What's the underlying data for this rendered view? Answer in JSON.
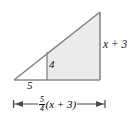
{
  "figure": {
    "type": "geometry-diagram",
    "shape": "right-triangle-with-inner-vertical",
    "top_cut_text": "",
    "labels": {
      "right_side": "x + 3",
      "inner_vertical": "4",
      "base_segment": "5",
      "dimension_numerator": "5",
      "dimension_denominator": "4",
      "dimension_expression": "(x + 3)"
    },
    "colors": {
      "fill": "#ecebeb",
      "stroke": "#6f6f6f",
      "text": "#111111"
    },
    "geometry": {
      "apex_top": [
        100,
        12
      ],
      "corner_bottom_right": [
        100,
        80
      ],
      "corner_bottom_left": [
        14,
        80
      ],
      "inner_vertical_x": 47,
      "inner_vertical_top": [
        47,
        52
      ],
      "dimension_arrow_left": 13,
      "dimension_arrow_right": 105,
      "dimension_arrow_y": 104
    }
  }
}
